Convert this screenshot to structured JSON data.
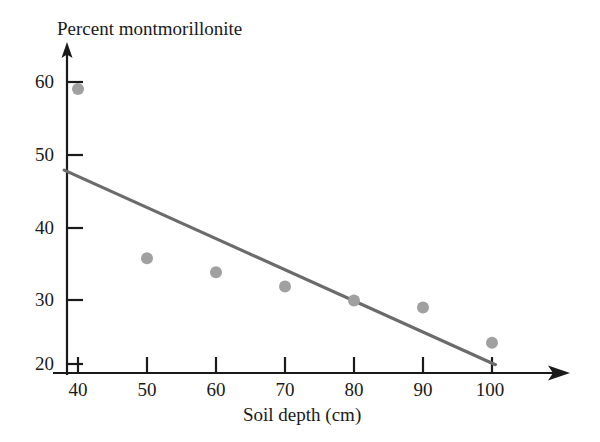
{
  "chart_data": {
    "type": "scatter",
    "title": "",
    "xlabel": "Soil depth (cm)",
    "ylabel": "Percent montmorillonite",
    "x": [
      40,
      50,
      60,
      70,
      80,
      90,
      100
    ],
    "values": [
      59,
      35,
      33,
      31,
      29,
      28,
      23
    ],
    "series": [
      {
        "name": "Percent montmorillonite",
        "values": [
          59,
          35,
          33,
          31,
          29,
          28,
          23
        ]
      }
    ],
    "points": [
      {
        "x": 40,
        "y": 59
      },
      {
        "x": 50,
        "y": 35
      },
      {
        "x": 60,
        "y": 33
      },
      {
        "x": 70,
        "y": 31
      },
      {
        "x": 80,
        "y": 29
      },
      {
        "x": 90,
        "y": 28
      },
      {
        "x": 100,
        "y": 23
      }
    ],
    "trendline": {
      "type": "line",
      "x_start": 38,
      "y_start": 47.5,
      "x_end": 100.5,
      "y_end": 19.9
    },
    "xlim": [
      38,
      110
    ],
    "ylim": [
      19,
      63
    ],
    "xticks": [
      40,
      50,
      60,
      70,
      80,
      90,
      100
    ],
    "xtick_labels": [
      "40",
      "50",
      "60",
      "70",
      "80",
      "90",
      "100"
    ],
    "yticks": [
      20,
      30,
      40,
      50,
      60
    ],
    "ytick_labels": [
      "20",
      "30",
      "40",
      "50",
      "60"
    ],
    "grid": false,
    "legend": null,
    "marker_color": "#a0a0a0",
    "line_color": "#6b6b6b",
    "axis_color": "#1a1a1a"
  },
  "axes": {
    "y_title": "Percent montmorillonite",
    "x_title": "Soil depth (cm)"
  }
}
